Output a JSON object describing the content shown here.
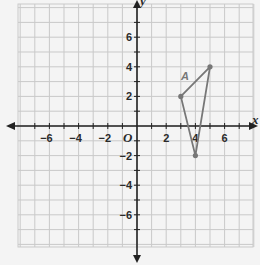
{
  "diagram": {
    "type": "coordinate-plane",
    "x_axis": {
      "label": "x",
      "ticks": [
        -6,
        -4,
        -2,
        2,
        4,
        6
      ],
      "tick_labels": [
        "−6",
        "−4",
        "−2",
        "2",
        "4",
        "6"
      ],
      "range": [
        -8,
        8
      ]
    },
    "y_axis": {
      "label": "y",
      "ticks": [
        6,
        4,
        2,
        -2,
        -4,
        -6
      ],
      "tick_labels": [
        "6",
        "4",
        "2",
        "−2",
        "−4",
        "−6"
      ],
      "range": [
        -8,
        8
      ]
    },
    "origin_label": "O",
    "figure": {
      "label": "A",
      "shape": "triangle",
      "vertices": [
        [
          3,
          2
        ],
        [
          5,
          4
        ],
        [
          4,
          -2
        ]
      ],
      "color": "#777777"
    },
    "grid": true
  }
}
